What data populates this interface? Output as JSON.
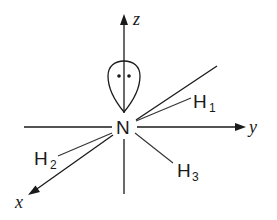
{
  "diagram": {
    "title": "",
    "colors": {
      "line": "#1a1a1a",
      "bond": "#333333",
      "background": "#ffffff"
    },
    "axes": {
      "x": {
        "label": "x"
      },
      "y": {
        "label": "y"
      },
      "z": {
        "label": "z"
      }
    },
    "central_atom": {
      "symbol": "N"
    },
    "hydrogens": [
      {
        "symbol": "H",
        "subscript": "1"
      },
      {
        "symbol": "H",
        "subscript": "2"
      },
      {
        "symbol": "H",
        "subscript": "3"
      }
    ],
    "lone_pair": {
      "electrons": 2,
      "symbol": "••"
    }
  }
}
